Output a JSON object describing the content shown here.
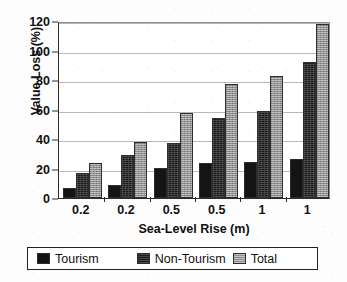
{
  "chart_data": {
    "type": "bar",
    "title": "",
    "xlabel": "Sea-Level Rise (m)",
    "ylabel": "Value Loss (%)",
    "categories": [
      "0.2",
      "0.2",
      "0.5",
      "0.5",
      "1",
      "1"
    ],
    "series": [
      {
        "name": "Tourism",
        "values": [
          7,
          9,
          20.5,
          24,
          24.5,
          26.5
        ]
      },
      {
        "name": "Non-Tourism",
        "values": [
          17,
          29,
          37,
          54,
          59,
          92
        ]
      },
      {
        "name": "Total",
        "values": [
          23.5,
          38,
          57.5,
          77,
          83,
          118
        ]
      }
    ],
    "ylim": [
      0,
      120
    ],
    "ytick_values": [
      0,
      20,
      40,
      60,
      80,
      100,
      120
    ],
    "ytick_labels": [
      "0",
      "20",
      "40",
      "60",
      "80",
      "100",
      "120"
    ],
    "grid": true,
    "legend_position": "bottom",
    "colors": {
      "tourism": "#141414",
      "non_tourism": "#1d1d1d",
      "total": "#8e8e8e",
      "gridline": "#b8b8b8",
      "axis": "#2b2b2b",
      "background": "#ffffff"
    }
  }
}
